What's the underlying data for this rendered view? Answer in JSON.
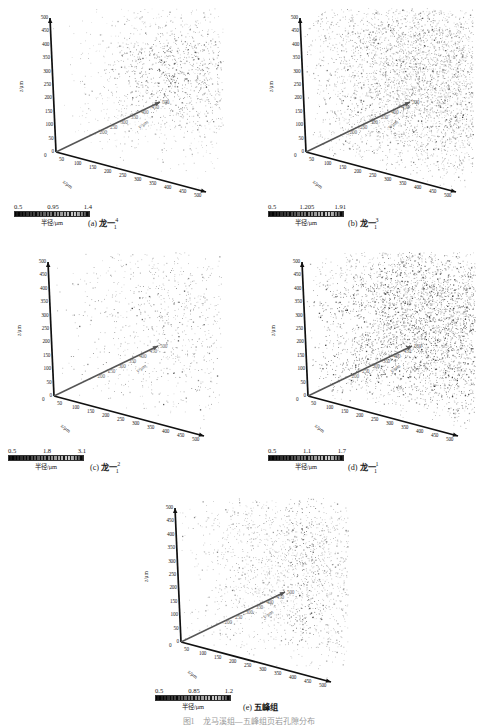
{
  "figure": {
    "axis_label_x": "x/μm",
    "axis_label_y": "y/μm",
    "axis_label_z": "z/μm",
    "colorbar_label": "半径/μm",
    "axis_ticks": [
      "0",
      "50",
      "100",
      "150",
      "200",
      "250",
      "300",
      "350",
      "400",
      "450",
      "500"
    ],
    "bottom_caption": "图1　龙马溪组—五峰组页岩孔隙分布"
  },
  "panels": [
    {
      "id": "a",
      "caption_prefix": "(a)",
      "caption_name": "龙一",
      "caption_sub": "1",
      "caption_sup": "4",
      "colorbar": {
        "min": "0.5",
        "mid": "0.95",
        "max": "1.4"
      },
      "density": "high-central-blob"
    },
    {
      "id": "b",
      "caption_prefix": "(b)",
      "caption_name": "龙一",
      "caption_sub": "1",
      "caption_sup": "3",
      "colorbar": {
        "min": "0.5",
        "mid": "1.205",
        "max": "1.91"
      },
      "density": "full-cube-dense"
    },
    {
      "id": "c",
      "caption_prefix": "(c)",
      "caption_name": "龙一",
      "caption_sub": "1",
      "caption_sup": "2",
      "colorbar": {
        "min": "0.5",
        "mid": "1.8",
        "max": "3.1"
      },
      "density": "sparse-clustered"
    },
    {
      "id": "d",
      "caption_prefix": "(d)",
      "caption_name": "龙一",
      "caption_sub": "1",
      "caption_sup": "1",
      "colorbar": {
        "min": "0.5",
        "mid": "1.1",
        "max": "1.7"
      },
      "density": "dense-banded"
    },
    {
      "id": "e",
      "caption_prefix": "(e)",
      "caption_name": "五峰组",
      "caption_sub": "",
      "caption_sup": "",
      "colorbar": {
        "min": "0.5",
        "mid": "0.85",
        "max": "1.2"
      },
      "density": "vertical-fracture"
    }
  ],
  "chart_data": {
    "type": "scatter",
    "title": "",
    "xlabel": "x/μm",
    "ylabel": "y/μm",
    "zlabel": "z/μm",
    "xlim": [
      0,
      500
    ],
    "ylim": [
      0,
      500
    ],
    "zlim": [
      0,
      500
    ],
    "grid": false,
    "legend": "none",
    "colormap": "grayscale",
    "colorbar_label": "半径/μm",
    "subplots": [
      {
        "id": "a",
        "label": "龙一1-4",
        "color_min": 0.5,
        "color_mid": 0.95,
        "color_max": 1.4
      },
      {
        "id": "b",
        "label": "龙一1-3",
        "color_min": 0.5,
        "color_mid": 1.205,
        "color_max": 1.91
      },
      {
        "id": "c",
        "label": "龙一1-2",
        "color_min": 0.5,
        "color_mid": 1.8,
        "color_max": 3.1
      },
      {
        "id": "d",
        "label": "龙一1-1",
        "color_min": 0.5,
        "color_mid": 1.1,
        "color_max": 1.7
      },
      {
        "id": "e",
        "label": "五峰组",
        "color_min": 0.5,
        "color_mid": 0.85,
        "color_max": 1.2
      }
    ],
    "tick_values": [
      0,
      50,
      100,
      150,
      200,
      250,
      300,
      350,
      400,
      450,
      500
    ]
  }
}
